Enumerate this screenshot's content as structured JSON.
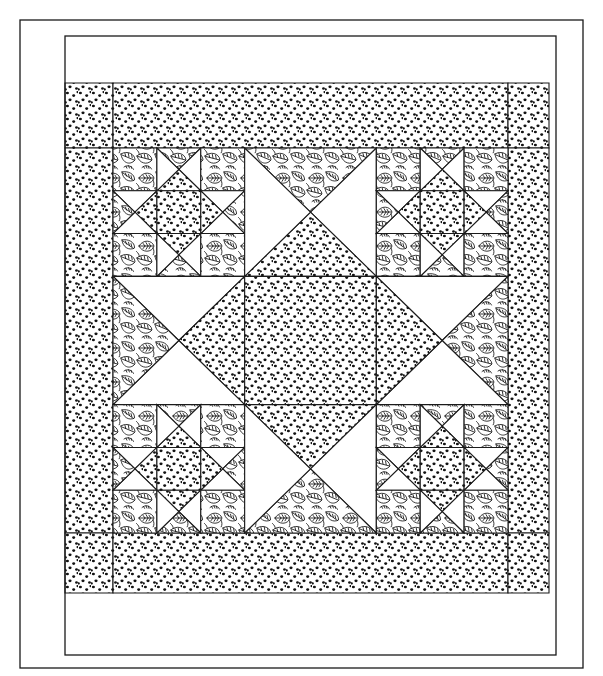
{
  "document": {
    "title": "Quilt Pattern Diagram",
    "subject": "Ohio Star medallion quilt line drawing",
    "view_label": "",
    "background_color": "#ffffff",
    "line_color": "#1a1a1a"
  },
  "canvas": {
    "width": 603,
    "height": 676
  },
  "fabrics": [
    {
      "key": "plain",
      "name": "plain-white-fabric",
      "label": "Plain / background",
      "fill": "#ffffff"
    },
    {
      "key": "dot",
      "name": "dotted-print-fabric",
      "label": "Dotted print",
      "fill": "#ffffff"
    },
    {
      "key": "leaf",
      "name": "leaf-print-fabric",
      "label": "Leaf print",
      "fill": "#ffffff"
    }
  ],
  "layout": {
    "outer_frame": {
      "name": "outer-frame",
      "x": 20,
      "y": 20,
      "w": 563,
      "h": 648
    },
    "inner_frame": {
      "name": "inner-border-frame",
      "x": 65,
      "y": 36,
      "w": 491,
      "h": 619
    },
    "border_band": {
      "name": "dotted-border-band",
      "x": 65,
      "y": 83,
      "w": 484,
      "h": 510,
      "fabric": "dot"
    },
    "center_block": {
      "name": "center-star-block",
      "x": 113,
      "y": 148,
      "w": 395,
      "h": 385
    },
    "grid": {
      "rows": 3,
      "cols": 3,
      "corner_subdivision": 3
    }
  },
  "center_block_cells": [
    {
      "row": 0,
      "col": 0,
      "name": "corner-ohio-star-top-left",
      "type": "ohio-star-9patch"
    },
    {
      "row": 0,
      "col": 1,
      "name": "star-point-top",
      "type": "quarter-square",
      "north": "leaf",
      "east": "plain",
      "south": "dot",
      "west": "plain"
    },
    {
      "row": 0,
      "col": 2,
      "name": "corner-ohio-star-top-right",
      "type": "ohio-star-9patch"
    },
    {
      "row": 1,
      "col": 0,
      "name": "star-point-left",
      "type": "quarter-square",
      "north": "plain",
      "east": "dot",
      "south": "plain",
      "west": "leaf"
    },
    {
      "row": 1,
      "col": 1,
      "name": "center-square-dotted",
      "type": "plain-square",
      "fabric": "dot"
    },
    {
      "row": 1,
      "col": 2,
      "name": "star-point-right",
      "type": "quarter-square",
      "north": "plain",
      "east": "leaf",
      "south": "plain",
      "west": "dot"
    },
    {
      "row": 2,
      "col": 0,
      "name": "corner-ohio-star-bottom-left",
      "type": "ohio-star-9patch"
    },
    {
      "row": 2,
      "col": 1,
      "name": "star-point-bottom",
      "type": "quarter-square",
      "north": "dot",
      "east": "plain",
      "south": "leaf",
      "west": "plain"
    },
    {
      "row": 2,
      "col": 2,
      "name": "corner-ohio-star-bottom-right",
      "type": "ohio-star-9patch"
    }
  ],
  "ohio_star_unit": {
    "name": "ohio-star-sub-block",
    "corners_fabric": "leaf",
    "center_fabric": "dot",
    "points": [
      {
        "position": "top",
        "name": "sub-star-point-top",
        "north": "leaf",
        "east": "plain",
        "south": "dot",
        "west": "plain"
      },
      {
        "position": "left",
        "name": "sub-star-point-left",
        "north": "plain",
        "east": "dot",
        "south": "plain",
        "west": "leaf"
      },
      {
        "position": "right",
        "name": "sub-star-point-right",
        "north": "plain",
        "east": "leaf",
        "south": "plain",
        "west": "dot"
      },
      {
        "position": "bottom",
        "name": "sub-star-point-bottom",
        "north": "dot",
        "east": "plain",
        "south": "leaf",
        "west": "plain"
      }
    ]
  },
  "chart_data": {
    "type": "table",
    "xlabel": "",
    "ylabel": "",
    "columns": [
      "Region",
      "Patches",
      "Fabric"
    ],
    "rows": [
      [
        "Outer border",
        "4 strips",
        "Plain / background"
      ],
      [
        "Inner border",
        "4 strips + 4 corner squares",
        "Dotted print"
      ],
      [
        "Center star points",
        "4 quarter-square units",
        "Leaf print / Dotted print / Plain"
      ],
      [
        "Center square",
        "1 square",
        "Dotted print"
      ],
      [
        "Corner blocks",
        "4 Ohio Star nine-patch blocks",
        "Leaf print / Dotted print / Plain"
      ]
    ]
  }
}
